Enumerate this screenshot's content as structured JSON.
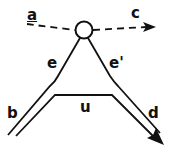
{
  "diagram": {
    "labels": {
      "a": "a",
      "c": "c",
      "e": "e",
      "e_prime": "e'",
      "b": "b",
      "u": "u",
      "d": "d"
    },
    "node": {
      "shape": "circle",
      "label": ""
    },
    "edges": [
      {
        "from": "a",
        "to": "node",
        "style": "dashed"
      },
      {
        "from": "node",
        "to": "c",
        "style": "dashed",
        "arrow": true
      },
      {
        "from": "node",
        "to": "b",
        "style": "double-line",
        "label": "e"
      },
      {
        "from": "node",
        "to": "d",
        "style": "double-line",
        "label": "e'",
        "arrow": true
      },
      {
        "from": "b",
        "to": "d",
        "style": "line",
        "label": "u"
      }
    ],
    "colors": {
      "stroke": "#111111",
      "background": "#ffffff"
    }
  }
}
